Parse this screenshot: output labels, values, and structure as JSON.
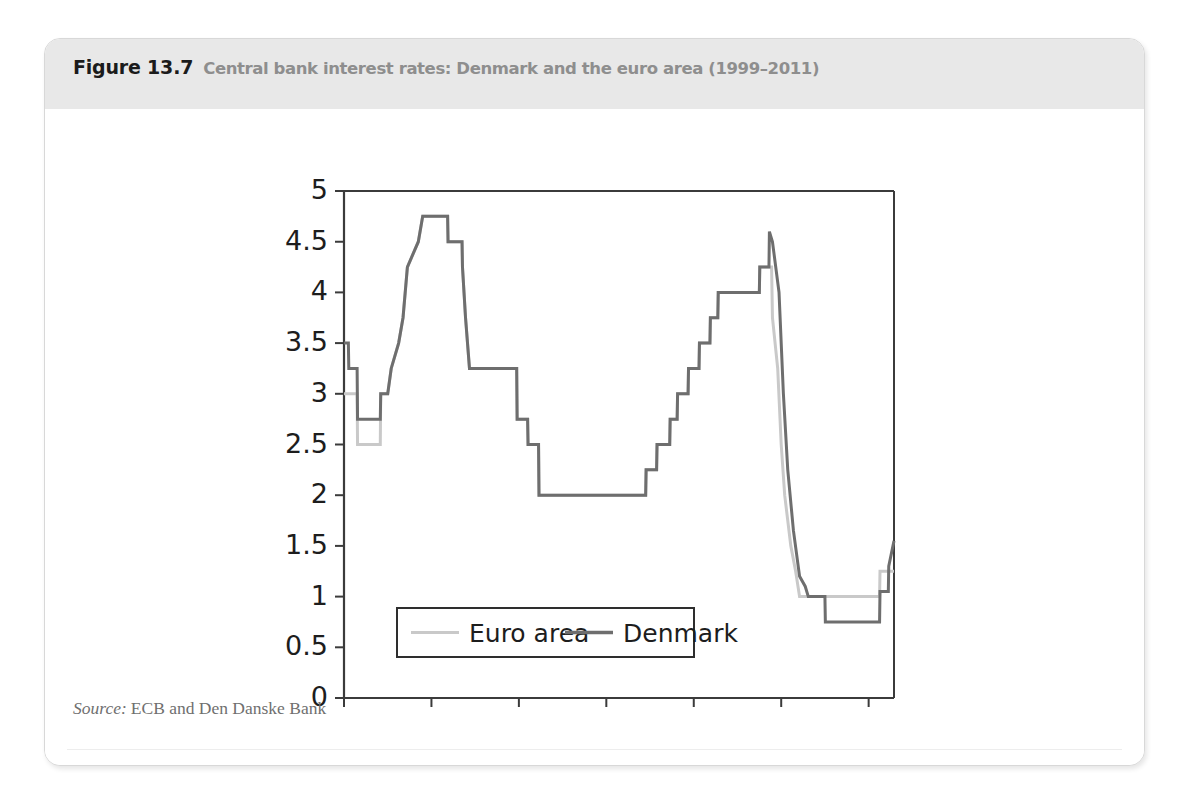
{
  "figure": {
    "number": "Figure 13.7",
    "caption": "Central bank interest rates: Denmark and the euro area (1999–2011)",
    "source_label": "Source:",
    "source_text": "ECB and Den Danske Bank"
  },
  "colors": {
    "header_band": "#e8e8e8",
    "number_text": "#1b1b1b",
    "caption_text": "#8e8e8e",
    "euro_area_line": "#c9c9c9",
    "denmark_line": "#6e6e6e",
    "axis": "#3b3b3b",
    "source_text": "#6f6f6f"
  },
  "chart_data": {
    "type": "line",
    "title": "Central bank interest rates: Denmark and the euro area (1999–2011)",
    "xlabel": "",
    "ylabel": "",
    "ylim": [
      0,
      5
    ],
    "ytick_values": [
      0,
      0.5,
      1,
      1.5,
      2,
      2.5,
      3,
      3.5,
      4,
      4.5,
      5
    ],
    "ytick_labels": [
      "0",
      "0.5",
      "1",
      "1.5",
      "2",
      "2.5",
      "3",
      "3.5",
      "4",
      "4.5",
      "5"
    ],
    "xlim": [
      "1999-01",
      "2011-07"
    ],
    "xtick_labels": [
      "Jan-99",
      "Jan-01",
      "Jan-03",
      "Jan-05",
      "Jan-07",
      "Jan-09",
      "Jan-11"
    ],
    "xtick_values": [
      1999.0,
      2001.0,
      2003.0,
      2005.0,
      2007.0,
      2009.0,
      2011.0
    ],
    "grid": false,
    "legend_position": "bottom-left-inside",
    "step_style": "post",
    "series": [
      {
        "name": "Euro area",
        "color": "#c9c9c9",
        "points": [
          [
            1999.0,
            3.0
          ],
          [
            1999.3,
            3.0
          ],
          [
            1999.31,
            2.5
          ],
          [
            1999.83,
            2.5
          ],
          [
            1999.84,
            3.0
          ],
          [
            2000.0,
            3.0
          ],
          [
            2000.08,
            3.25
          ],
          [
            2000.25,
            3.5
          ],
          [
            2000.35,
            3.75
          ],
          [
            2000.45,
            4.25
          ],
          [
            2000.7,
            4.5
          ],
          [
            2000.8,
            4.75
          ],
          [
            2001.37,
            4.75
          ],
          [
            2001.38,
            4.5
          ],
          [
            2001.7,
            4.5
          ],
          [
            2001.71,
            4.25
          ],
          [
            2001.78,
            3.75
          ],
          [
            2001.87,
            3.25
          ],
          [
            2002.95,
            3.25
          ],
          [
            2002.96,
            2.75
          ],
          [
            2003.2,
            2.75
          ],
          [
            2003.21,
            2.5
          ],
          [
            2003.45,
            2.5
          ],
          [
            2003.46,
            2.0
          ],
          [
            2005.9,
            2.0
          ],
          [
            2005.91,
            2.25
          ],
          [
            2006.15,
            2.25
          ],
          [
            2006.16,
            2.5
          ],
          [
            2006.45,
            2.5
          ],
          [
            2006.46,
            2.75
          ],
          [
            2006.62,
            2.75
          ],
          [
            2006.63,
            3.0
          ],
          [
            2006.87,
            3.0
          ],
          [
            2006.88,
            3.25
          ],
          [
            2007.12,
            3.25
          ],
          [
            2007.13,
            3.5
          ],
          [
            2007.37,
            3.5
          ],
          [
            2007.38,
            3.75
          ],
          [
            2007.55,
            3.75
          ],
          [
            2007.56,
            4.0
          ],
          [
            2008.5,
            4.0
          ],
          [
            2008.51,
            4.25
          ],
          [
            2008.78,
            4.25
          ],
          [
            2008.8,
            3.75
          ],
          [
            2008.92,
            3.25
          ],
          [
            2009.0,
            2.5
          ],
          [
            2009.08,
            2.0
          ],
          [
            2009.22,
            1.5
          ],
          [
            2009.33,
            1.25
          ],
          [
            2009.42,
            1.0
          ],
          [
            2011.25,
            1.0
          ],
          [
            2011.26,
            1.25
          ],
          [
            2011.58,
            1.25
          ]
        ]
      },
      {
        "name": "Denmark",
        "color": "#6e6e6e",
        "points": [
          [
            1999.0,
            3.5
          ],
          [
            1999.1,
            3.5
          ],
          [
            1999.11,
            3.25
          ],
          [
            1999.3,
            3.25
          ],
          [
            1999.31,
            2.75
          ],
          [
            1999.83,
            2.75
          ],
          [
            1999.84,
            3.0
          ],
          [
            2000.0,
            3.0
          ],
          [
            2000.08,
            3.25
          ],
          [
            2000.25,
            3.5
          ],
          [
            2000.35,
            3.75
          ],
          [
            2000.45,
            4.25
          ],
          [
            2000.7,
            4.5
          ],
          [
            2000.8,
            4.75
          ],
          [
            2001.37,
            4.75
          ],
          [
            2001.38,
            4.5
          ],
          [
            2001.7,
            4.5
          ],
          [
            2001.71,
            4.25
          ],
          [
            2001.78,
            3.75
          ],
          [
            2001.87,
            3.25
          ],
          [
            2002.95,
            3.25
          ],
          [
            2002.96,
            2.75
          ],
          [
            2003.2,
            2.75
          ],
          [
            2003.21,
            2.5
          ],
          [
            2003.45,
            2.5
          ],
          [
            2003.46,
            2.0
          ],
          [
            2005.9,
            2.0
          ],
          [
            2005.91,
            2.25
          ],
          [
            2006.15,
            2.25
          ],
          [
            2006.16,
            2.5
          ],
          [
            2006.45,
            2.5
          ],
          [
            2006.46,
            2.75
          ],
          [
            2006.62,
            2.75
          ],
          [
            2006.63,
            3.0
          ],
          [
            2006.87,
            3.0
          ],
          [
            2006.88,
            3.25
          ],
          [
            2007.12,
            3.25
          ],
          [
            2007.13,
            3.5
          ],
          [
            2007.37,
            3.5
          ],
          [
            2007.38,
            3.75
          ],
          [
            2007.55,
            3.75
          ],
          [
            2007.56,
            4.0
          ],
          [
            2008.5,
            4.0
          ],
          [
            2008.51,
            4.25
          ],
          [
            2008.72,
            4.25
          ],
          [
            2008.73,
            4.6
          ],
          [
            2008.8,
            4.5
          ],
          [
            2008.95,
            4.0
          ],
          [
            2009.05,
            3.0
          ],
          [
            2009.15,
            2.25
          ],
          [
            2009.28,
            1.65
          ],
          [
            2009.42,
            1.2
          ],
          [
            2009.55,
            1.1
          ],
          [
            2009.62,
            1.0
          ],
          [
            2010.0,
            1.0
          ],
          [
            2010.01,
            0.75
          ],
          [
            2011.25,
            0.75
          ],
          [
            2011.26,
            1.05
          ],
          [
            2011.45,
            1.05
          ],
          [
            2011.46,
            1.3
          ],
          [
            2011.58,
            1.55
          ]
        ]
      }
    ],
    "legend": [
      {
        "label": "Euro area",
        "color": "#c9c9c9"
      },
      {
        "label": "Denmark",
        "color": "#6e6e6e"
      }
    ]
  }
}
